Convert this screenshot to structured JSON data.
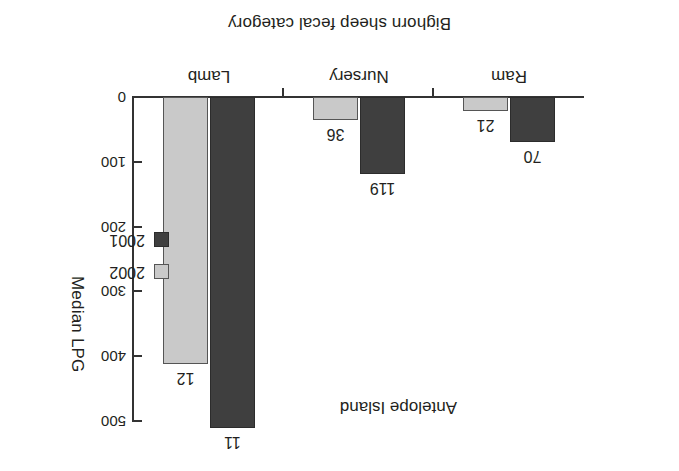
{
  "figure": {
    "site_annotation": "Antelope Island",
    "orientation_note": "rotated-180"
  },
  "axes": {
    "y_title": "Median LPG",
    "x_title": "Bighorn sheep fecal category",
    "y_ticks": [
      "0",
      "100",
      "200",
      "300",
      "400",
      "500"
    ],
    "y_tick_values": [
      0,
      100,
      200,
      300,
      400,
      500
    ],
    "y_min": 0,
    "y_max": 500
  },
  "legend": {
    "items": [
      {
        "label": "2002",
        "color": "#c9c9c9"
      },
      {
        "label": "2001",
        "color": "#3f3f3f"
      }
    ]
  },
  "categories": [
    {
      "label": "Ram"
    },
    {
      "label": "Nursery"
    },
    {
      "label": "Lamb"
    }
  ],
  "bars": [
    {
      "category": "Ram",
      "series": "2001",
      "value": 70,
      "label": "70"
    },
    {
      "category": "Ram",
      "series": "2002",
      "value": 21,
      "label": "21"
    },
    {
      "category": "Nursery",
      "series": "2001",
      "value": 119,
      "label": "119"
    },
    {
      "category": "Nursery",
      "series": "2002",
      "value": 36,
      "label": "36"
    },
    {
      "category": "Lamb",
      "series": "2001",
      "value": 511,
      "label": "11"
    },
    {
      "category": "Lamb",
      "series": "2002",
      "value": 412,
      "label": "12"
    }
  ],
  "chart_data": {
    "type": "bar",
    "title": "Antelope Island",
    "xlabel": "Bighorn sheep fecal category",
    "ylabel": "Median LPG",
    "categories": [
      "Ram",
      "Nursery",
      "Lamb"
    ],
    "series": [
      {
        "name": "2001",
        "color": "#3f3f3f",
        "values": [
          70,
          119,
          511
        ],
        "data_labels": [
          "70",
          "119",
          "11"
        ]
      },
      {
        "name": "2002",
        "color": "#c9c9c9",
        "values": [
          21,
          36,
          412
        ],
        "data_labels": [
          "21",
          "36",
          "12"
        ]
      }
    ],
    "ylim": [
      0,
      500
    ],
    "yticks": [
      0,
      100,
      200,
      300,
      400,
      500
    ],
    "grid": false,
    "legend_position": "right",
    "orientation": "vertical-grouped"
  }
}
